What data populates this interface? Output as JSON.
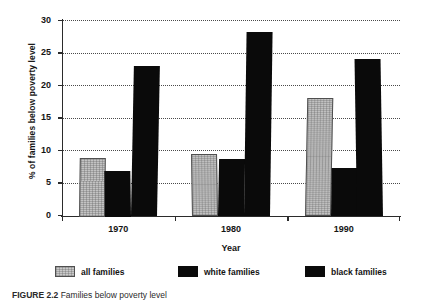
{
  "chart_data": {
    "type": "bar",
    "title": "",
    "xlabel": "Year",
    "ylabel": "% of families below poverty level",
    "categories": [
      "1970",
      "1980",
      "1990"
    ],
    "series": [
      {
        "name": "all families",
        "values": [
          9.0,
          9.6,
          18.2
        ]
      },
      {
        "name": "white families",
        "values": [
          7.0,
          8.7,
          7.4
        ]
      },
      {
        "name": "black families",
        "values": [
          23.1,
          28.3,
          24.2
        ]
      }
    ],
    "ylim": [
      0,
      30
    ],
    "yticks": [
      0,
      5,
      10,
      15,
      20,
      25,
      30
    ],
    "ytick_labels": [
      "0",
      "5",
      "10",
      "15",
      "20",
      "25",
      "30"
    ],
    "grid": "horizontal-dotted",
    "legend_position": "bottom"
  },
  "legend": {
    "items": [
      {
        "label": "all families",
        "swatch": "gray"
      },
      {
        "label": "white families",
        "swatch": "black"
      },
      {
        "label": "black families",
        "swatch": "black"
      }
    ]
  },
  "caption": {
    "prefix": "FIGURE 2.2",
    "text": "Families below poverty level"
  }
}
